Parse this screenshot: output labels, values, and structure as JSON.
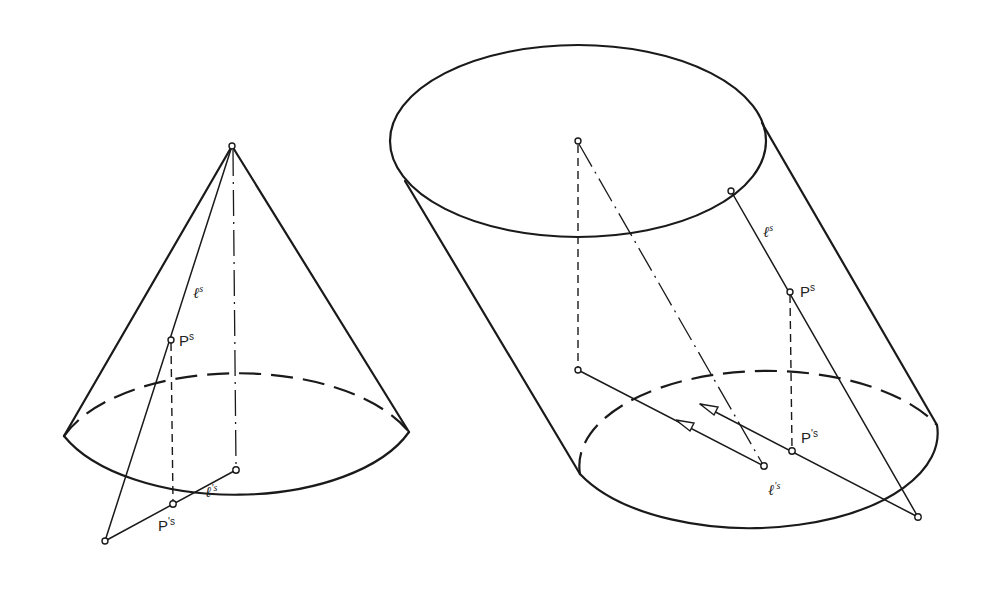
{
  "figure": {
    "left": {
      "name": "cone",
      "apex": [
        232,
        146
      ],
      "base_center": [
        236,
        470
      ],
      "base_rx": 185,
      "base_ry": 95,
      "tangent_left": [
        64,
        436
      ],
      "tangent_right": [
        409,
        432
      ],
      "base_point": [
        105,
        541
      ],
      "P_s": [
        171,
        340
      ],
      "P_prime_s": [
        173,
        504
      ],
      "labels": {
        "l_s": {
          "text": "ℓ",
          "sup": "s",
          "pos": [
            193,
            298
          ]
        },
        "P_s": {
          "text": "P",
          "sup": "s",
          "pos": [
            179,
            346
          ]
        },
        "l_prime_s": {
          "text": "ℓ",
          "sup": "'s",
          "pos": [
            205,
            497
          ]
        },
        "P_prime_s": {
          "text": "P",
          "sup": "'s",
          "pos": [
            158,
            531
          ]
        }
      }
    },
    "right": {
      "name": "oblique-cylinder",
      "top_center": [
        578,
        141
      ],
      "top_rx": 188,
      "top_ry": 96,
      "bottom_center": [
        764,
        466
      ],
      "bottom_rx": 188,
      "bottom_ry": 95,
      "top_left_tangent": [
        405,
        181
      ],
      "bottom_left_tangent": [
        580,
        474
      ],
      "top_right_tangent": [
        762,
        123
      ],
      "bottom_right_tangent": [
        937,
        425
      ],
      "top_point": [
        731,
        191
      ],
      "P_s": [
        790,
        292
      ],
      "P_prime_s": [
        792,
        451
      ],
      "base_point": [
        918,
        517
      ],
      "foot": [
        578,
        370
      ],
      "labels": {
        "l_s": {
          "text": "ℓ",
          "sup": "s",
          "pos": [
            763,
            237
          ]
        },
        "P_s": {
          "text": "P",
          "sup": "s",
          "pos": [
            800,
            297
          ]
        },
        "P_prime_s": {
          "text": "P",
          "sup": "'s",
          "pos": [
            801,
            443
          ]
        },
        "l_prime_s": {
          "text": "ℓ",
          "sup": "'s",
          "pos": [
            768,
            495
          ]
        }
      }
    }
  },
  "colors": {
    "ink": "#1a1a1a",
    "paper": "#ffffff"
  }
}
